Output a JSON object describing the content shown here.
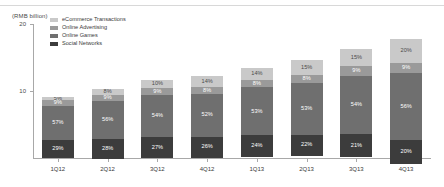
{
  "axis_unit": "(RMB billion)",
  "legend": {
    "items": [
      {
        "label": "eCommerce Transactions",
        "color": "#c9c9c9"
      },
      {
        "label": "Online Advertising",
        "color": "#9a9a9a"
      },
      {
        "label": "Online Games",
        "color": "#6f6f6f"
      },
      {
        "label": "Social Networks",
        "color": "#3c3c3c"
      }
    ]
  },
  "chart_data": {
    "type": "bar",
    "title": "",
    "xlabel": "",
    "ylabel": "(RMB billion)",
    "ylim": [
      0,
      20
    ],
    "yticks": [
      10,
      20
    ],
    "ytick_labels": [
      "10",
      "20"
    ],
    "grid": false,
    "stacked": true,
    "stack_mode": "percent-labels-on-absolute-bars",
    "legend_position": "top-left",
    "categories": [
      "1Q12",
      "2Q12",
      "3Q12",
      "4Q12",
      "1Q13",
      "2Q13",
      "3Q13",
      "4Q13"
    ],
    "totals": [
      9.1,
      10.3,
      11.6,
      12.3,
      13.5,
      14.6,
      16.2,
      17.8
    ],
    "series": [
      {
        "name": "Social Networks",
        "color": "#3c3c3c",
        "values": [
          29,
          28,
          27,
          26,
          24,
          22,
          21,
          20
        ],
        "unit": "%"
      },
      {
        "name": "Online Games",
        "color": "#6f6f6f",
        "values": [
          57,
          56,
          54,
          52,
          53,
          53,
          54,
          56
        ],
        "unit": "%"
      },
      {
        "name": "Online Advertising",
        "color": "#9a9a9a",
        "values": [
          9,
          9,
          9,
          8,
          8,
          8,
          9,
          9
        ],
        "unit": "%"
      },
      {
        "name": "eCommerce Transactions",
        "color": "#c9c9c9",
        "values": [
          5,
          8,
          10,
          14,
          14,
          15,
          15,
          20
        ],
        "unit": "%"
      }
    ],
    "bar_labels": [
      [
        "29%",
        "57%",
        "9%",
        "5%"
      ],
      [
        "28%",
        "56%",
        "9%",
        "8%"
      ],
      [
        "27%",
        "54%",
        "9%",
        "10%"
      ],
      [
        "26%",
        "52%",
        "8%",
        "14%"
      ],
      [
        "24%",
        "53%",
        "8%",
        "14%"
      ],
      [
        "22%",
        "53%",
        "8%",
        "15%"
      ],
      [
        "21%",
        "54%",
        "9%",
        "15%"
      ],
      [
        "20%",
        "56%",
        "9%",
        "20%"
      ]
    ]
  }
}
